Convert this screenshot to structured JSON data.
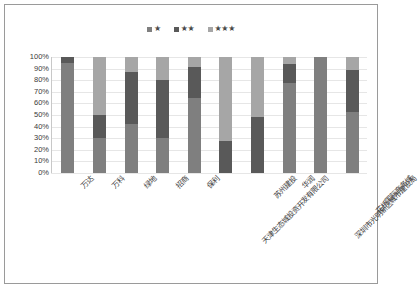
{
  "chart_data": {
    "type": "bar",
    "subtype": "100% stacked column",
    "title": "",
    "xlabel": "",
    "ylabel": "",
    "ylim": [
      0,
      100
    ],
    "grid": true,
    "legend_position": "top-center",
    "categories": [
      "万达",
      "万科",
      "绿地",
      "招商",
      "保利",
      "天津生态城投资开发有限公司",
      "苏州建投",
      "华润",
      "深圳市光明新区城市建设局",
      "花桥国际商务城"
    ],
    "ytick_labels": [
      "100%",
      "90%",
      "80%",
      "70%",
      "60%",
      "50%",
      "40%",
      "30%",
      "20%",
      "10%",
      "0%"
    ],
    "ytick_values": [
      100,
      90,
      80,
      70,
      60,
      50,
      40,
      30,
      20,
      10,
      0
    ],
    "series": [
      {
        "name": "★",
        "color": "#7f7f7f",
        "values": [
          95,
          30,
          42,
          30,
          65,
          0,
          0,
          78,
          100,
          53
        ]
      },
      {
        "name": "★★",
        "color": "#595959",
        "values": [
          5,
          20,
          45,
          50,
          26,
          28,
          48,
          16,
          0,
          36
        ]
      },
      {
        "name": "★★★",
        "color": "#a6a6a6",
        "values": [
          0,
          50,
          13,
          20,
          9,
          72,
          52,
          6,
          0,
          11
        ]
      }
    ]
  },
  "legend": {
    "items": [
      {
        "label": "★",
        "color": "#7f7f7f"
      },
      {
        "label": "★★",
        "color": "#595959"
      },
      {
        "label": "★★★",
        "color": "#a6a6a6"
      }
    ]
  },
  "colors": {
    "series_1": "#7f7f7f",
    "series_2": "#595959",
    "series_3": "#a6a6a6",
    "gridline": "#e6e6e6",
    "border": "#9a9a9a",
    "text": "#3a3a3a",
    "background": "#ffffff"
  }
}
